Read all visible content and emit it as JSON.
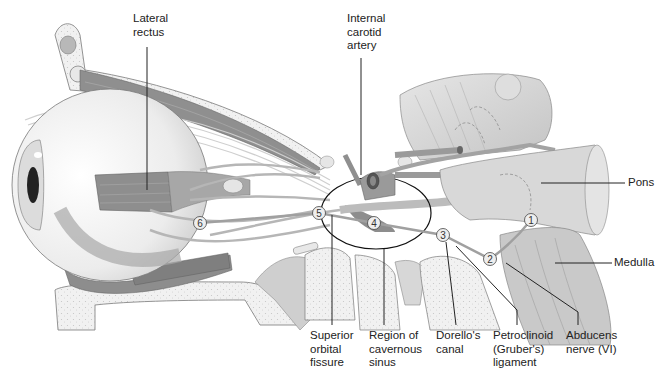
{
  "figure": {
    "type": "anatomical-diagram"
  },
  "labels": {
    "lateral_rectus": "Lateral\nrectus",
    "internal_carotid_artery": "Internal\ncarotid\nartery",
    "pons": "Pons",
    "medulla": "Medulla",
    "superior_orbital_fissure": "Superior\norbital\nfissure",
    "region_of_cavernous_sinus": "Region of\ncavernous\nsinus",
    "dorellos_canal": "Dorello's\ncanal",
    "petroclinoid_ligament": "Petroclinoid\n(Gruber's)\nligament",
    "abducens_nerve": "Abducens\nnerve (VI)"
  },
  "markers": [
    {
      "id": "1",
      "x": 531,
      "y": 220
    },
    {
      "id": "2",
      "x": 490,
      "y": 259
    },
    {
      "id": "3",
      "x": 443,
      "y": 235
    },
    {
      "id": "4",
      "x": 374,
      "y": 223
    },
    {
      "id": "5",
      "x": 319,
      "y": 213
    },
    {
      "id": "6",
      "x": 200,
      "y": 223
    }
  ],
  "colors": {
    "bone": "#efefef",
    "bone_stipple": "#c9c9c9",
    "muscle": "#9d9d9d",
    "muscle_dark": "#7d7d7d",
    "nerve": "#bdbdbd",
    "brainstem": "#d9d9d9",
    "outline": "#555555",
    "leader": "#222222"
  }
}
